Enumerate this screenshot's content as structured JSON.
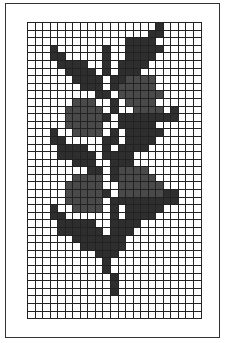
{
  "grid": {
    "columns": 23,
    "rows": 39
  },
  "legend": {
    "d": "leaf / stem (dark)",
    "b": "berry (medium)"
  },
  "colors": {
    "dark": "#2e2e2e",
    "berry": "#4a4a4a",
    "empty": "#ffffff",
    "line": "#222222"
  },
  "pattern": [
    ".................d.....",
    "................dd.....",
    ".............dddd......",
    "...d......d..ddddd.....",
    "...dd.....d..dddd......",
    "....dddd..d.dddd.......",
    ".....dddd.d.ddd........",
    "......dddd.ddbbbb......",
    ".......ddd.dbbbbb......",
    ".........dd.bbbbbb.....",
    "......bbb..d.bbbb......",
    ".....bbbbb.d..bbbb.d...",
    ".....bbbbbd.dddddddd...",
    ".....bbbbb..ddddd......",
    "...d..bbbb.d.ddddd.....",
    "...dd.....dd.dddd......",
    "....dddd..d.dddd.......",
    "....ddddd.dddd.........",
    "......ddd..ddd.........",
    "........dd.dbbbb.......",
    "......bbbb.dbbbbb......",
    ".....bbbbb..bbbbbb.....",
    ".....bbbbbd.bbbbbbdd...",
    ".....bbbbb.ddddddddd...",
    "...d..bbbb.d.ddddd.....",
    "...dd......d.dddd......",
    "....ddddd..dddd........",
    "....dddddd.ddd.........",
    "......ddddddd..........",
    ".......dddddd..........",
    ".........ddd...........",
    "..........d............",
    "..........d............",
    "...........d...........",
    "...........d...........",
    "...........d...........",
    ".......................",
    ".......................",
    "......................."
  ]
}
